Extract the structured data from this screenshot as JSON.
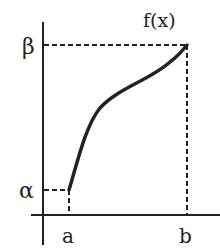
{
  "diagram": {
    "function_label": "f(x)",
    "y_labels": {
      "top": "β",
      "bottom": "α"
    },
    "x_labels": {
      "left": "a",
      "right": "b"
    },
    "colors": {
      "ink": "#222222",
      "background": "#ffffff"
    }
  }
}
